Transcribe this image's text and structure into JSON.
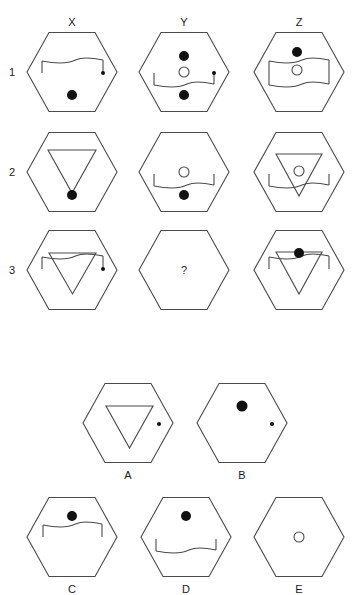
{
  "puzzle": {
    "column_headers": [
      {
        "label": "X",
        "x": 72
      },
      {
        "label": "Y",
        "x": 184
      },
      {
        "label": "Z",
        "x": 299
      }
    ],
    "row_labels": [
      {
        "label": "1",
        "y": 72
      },
      {
        "label": "2",
        "y": 172
      },
      {
        "label": "3",
        "y": 270
      }
    ],
    "missing_cell_label": "?",
    "stroke_color": "#4a4a4a",
    "fill_color": "#111111",
    "grid": [
      {
        "name": "cell-1-x",
        "cx": 72,
        "cy": 72,
        "elements": [
          {
            "type": "bracket-down",
            "x1": 42,
            "x2": 103,
            "y": 61,
            "leg": 12,
            "dot_right": true
          },
          {
            "type": "dot",
            "x": 72,
            "y": 95,
            "r": 5
          }
        ]
      },
      {
        "name": "cell-1-y",
        "cx": 184,
        "cy": 72,
        "elements": [
          {
            "type": "dot",
            "x": 184,
            "y": 56,
            "r": 5
          },
          {
            "type": "circle",
            "x": 184,
            "y": 72,
            "r": 5
          },
          {
            "type": "bracket-up",
            "x1": 154,
            "x2": 214,
            "y": 85,
            "leg": 12,
            "dot_right": true
          },
          {
            "type": "dot",
            "x": 184,
            "y": 95,
            "r": 5
          }
        ]
      },
      {
        "name": "cell-1-z",
        "cx": 299,
        "cy": 72,
        "elements": [
          {
            "type": "dot",
            "x": 297,
            "y": 52,
            "r": 5
          },
          {
            "type": "box",
            "x1": 269,
            "x2": 329,
            "y1": 61,
            "y2": 85
          },
          {
            "type": "circle",
            "x": 297,
            "y": 70,
            "r": 5
          }
        ]
      },
      {
        "name": "cell-2-x",
        "cx": 72,
        "cy": 172,
        "elements": [
          {
            "type": "triangle",
            "x1": 48,
            "x2": 96,
            "y": 150,
            "apex": 193
          },
          {
            "type": "dot",
            "x": 72,
            "y": 195,
            "r": 5
          }
        ]
      },
      {
        "name": "cell-2-y",
        "cx": 184,
        "cy": 172,
        "elements": [
          {
            "type": "circle",
            "x": 184,
            "y": 172,
            "r": 5
          },
          {
            "type": "bracket-up",
            "x1": 154,
            "x2": 214,
            "y": 186,
            "leg": 12,
            "dot_right": false
          },
          {
            "type": "dot",
            "x": 184,
            "y": 195,
            "r": 5
          }
        ]
      },
      {
        "name": "cell-2-z",
        "cx": 299,
        "cy": 172,
        "elements": [
          {
            "type": "triangle",
            "x1": 276,
            "x2": 322,
            "y": 154,
            "apex": 196
          },
          {
            "type": "circle",
            "x": 299,
            "y": 171,
            "r": 5
          },
          {
            "type": "bracket-up",
            "x1": 269,
            "x2": 329,
            "y": 186,
            "leg": 12,
            "dot_right": false
          }
        ]
      },
      {
        "name": "cell-3-x",
        "cx": 72,
        "cy": 270,
        "elements": [
          {
            "type": "triangle",
            "x1": 49,
            "x2": 96,
            "y": 253,
            "apex": 294
          },
          {
            "type": "bracket-down",
            "x1": 42,
            "x2": 103,
            "y": 257,
            "leg": 12,
            "dot_right": true
          }
        ]
      },
      {
        "name": "cell-3-y",
        "cx": 184,
        "cy": 270,
        "elements": [],
        "missing": true
      },
      {
        "name": "cell-3-z",
        "cx": 299,
        "cy": 270,
        "elements": [
          {
            "type": "triangle",
            "x1": 276,
            "x2": 322,
            "y": 252,
            "apex": 294
          },
          {
            "type": "bracket-down",
            "x1": 269,
            "x2": 329,
            "y": 257,
            "leg": 12,
            "dot_right": false
          },
          {
            "type": "dot",
            "x": 299,
            "y": 253,
            "r": 5
          }
        ]
      }
    ]
  },
  "options": [
    {
      "label": "A",
      "cx": 128,
      "cy": 423,
      "label_y": 475,
      "elements": [
        {
          "type": "triangle",
          "x1": 106,
          "x2": 153,
          "y": 406,
          "apex": 448
        },
        {
          "type": "smalldot",
          "x": 159,
          "y": 424,
          "r": 2
        }
      ]
    },
    {
      "label": "B",
      "cx": 242,
      "cy": 423,
      "label_y": 475,
      "elements": [
        {
          "type": "dot",
          "x": 242,
          "y": 406,
          "r": 5.5
        },
        {
          "type": "smalldot",
          "x": 272,
          "y": 424,
          "r": 2
        }
      ]
    },
    {
      "label": "C",
      "cx": 72,
      "cy": 537,
      "label_y": 589,
      "elements": [
        {
          "type": "dot",
          "x": 72,
          "y": 516,
          "r": 5
        },
        {
          "type": "bracket-down",
          "x1": 43,
          "x2": 102,
          "y": 525,
          "leg": 12,
          "dot_right": false
        }
      ]
    },
    {
      "label": "D",
      "cx": 186,
      "cy": 537,
      "label_y": 589,
      "elements": [
        {
          "type": "dot",
          "x": 186,
          "y": 516,
          "r": 5
        },
        {
          "type": "bracket-up",
          "x1": 156,
          "x2": 216,
          "y": 551,
          "leg": 12,
          "dot_right": false
        }
      ]
    },
    {
      "label": "E",
      "cx": 299,
      "cy": 537,
      "label_y": 589,
      "elements": [
        {
          "type": "circle",
          "x": 299,
          "y": 537,
          "r": 5
        }
      ]
    }
  ]
}
